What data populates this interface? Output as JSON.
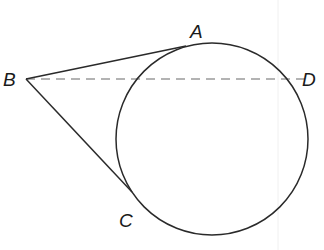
{
  "diagram": {
    "type": "geometry",
    "colors": {
      "background": "#ffffff",
      "stroke": "#2a2a2a",
      "dashed": "#9a9a9a",
      "guide": "#eeeeee",
      "label": "#1a1a1a"
    },
    "circle": {
      "cx": 212,
      "cy": 139,
      "r": 96
    },
    "points": [
      {
        "id": "A",
        "label": "A",
        "x": 186,
        "y": 46,
        "label_x": 190,
        "label_y": 38
      },
      {
        "id": "B",
        "label": "B",
        "x": 26,
        "y": 79,
        "label_x": 3,
        "label_y": 86
      },
      {
        "id": "C",
        "label": "C",
        "x": 132,
        "y": 192,
        "label_x": 119,
        "label_y": 227
      },
      {
        "id": "D",
        "label": "D",
        "x": 305,
        "y": 79,
        "label_x": 302,
        "label_y": 86
      }
    ],
    "segments": [
      {
        "from": "B",
        "to": "A",
        "style": "solid",
        "relation": "tangent"
      },
      {
        "from": "B",
        "to": "C",
        "style": "solid",
        "relation": "tangent"
      },
      {
        "from": "B",
        "to": "D",
        "style": "dashed"
      }
    ],
    "labels": {
      "A": "A",
      "B": "B",
      "C": "C",
      "D": "D"
    }
  }
}
